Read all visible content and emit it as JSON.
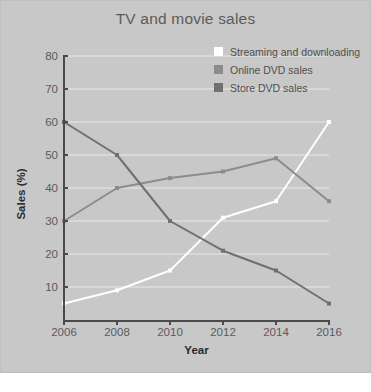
{
  "figure": {
    "panel_bg": "#c8c8c8",
    "page_bg": "#ffffff"
  },
  "chart_data": {
    "type": "line",
    "title": "TV and movie sales",
    "xlabel": "Year",
    "ylabel": "Sales (%)",
    "categories": [
      2006,
      2008,
      2010,
      2012,
      2014,
      2016
    ],
    "xtick_labels": [
      "2006",
      "2008",
      "2010",
      "2012",
      "2014",
      "2016"
    ],
    "ytick_labels": [
      "10",
      "20",
      "30",
      "40",
      "50",
      "60",
      "70",
      "80"
    ],
    "yticks": [
      10,
      20,
      30,
      40,
      50,
      60,
      70,
      80
    ],
    "ylim": [
      0,
      80
    ],
    "xlim": [
      2006,
      2016
    ],
    "grid": "horizontal",
    "grid_color": "#e8e8e8",
    "legend_position": "top-right",
    "series": [
      {
        "name": "Streaming and downloading",
        "color": "#ffffff",
        "values": [
          5,
          9,
          15,
          31,
          36,
          60
        ]
      },
      {
        "name": "Online DVD sales",
        "color": "#8c8c8c",
        "values": [
          30,
          40,
          43,
          45,
          49,
          36
        ]
      },
      {
        "name": "Store DVD sales",
        "color": "#707070",
        "values": [
          60,
          50,
          30,
          21,
          15,
          5
        ]
      }
    ]
  }
}
